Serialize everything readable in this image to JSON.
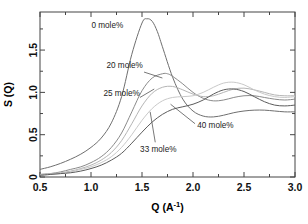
{
  "chart_data": {
    "type": "line",
    "title": "",
    "xlabel": "Q (A-1)",
    "xlabel_base": "Q (A",
    "xlabel_sup": "-1",
    "xlabel_tail": ")",
    "ylabel": "S (Q)",
    "xlim": [
      0.5,
      3.0
    ],
    "ylim": [
      0.0,
      1.95
    ],
    "grid": false,
    "legend_position": "inline-annotations",
    "xticks": [
      0.5,
      1.0,
      1.5,
      2.0,
      2.5,
      3.0
    ],
    "xtick_labels": [
      "0.5",
      "1.0",
      "1.5",
      "2.0",
      "2.5",
      "3.0"
    ],
    "xticks_minor": [
      0.75,
      1.25,
      1.75,
      2.25,
      2.75
    ],
    "yticks": [
      0.0,
      0.5,
      1.0,
      1.5
    ],
    "ytick_labels": [
      "0",
      "0.5",
      "1.0",
      "1.5"
    ],
    "yticks_minor": [
      0.25,
      0.75,
      1.25,
      1.75
    ],
    "series": [
      {
        "name": "0 mole%",
        "color": "#6f6f6f",
        "width": 1.0,
        "x": [
          0.5,
          0.6,
          0.7,
          0.8,
          0.9,
          1.0,
          1.1,
          1.2,
          1.3,
          1.4,
          1.5,
          1.55,
          1.6,
          1.65,
          1.7,
          1.8,
          1.9,
          2.0,
          2.1,
          2.2,
          2.3,
          2.4,
          2.5,
          2.6,
          2.7,
          2.8,
          2.9,
          3.0
        ],
        "y": [
          0.09,
          0.12,
          0.16,
          0.21,
          0.27,
          0.35,
          0.46,
          0.64,
          0.95,
          1.45,
          1.82,
          1.87,
          1.84,
          1.72,
          1.54,
          1.18,
          0.92,
          0.78,
          0.72,
          0.71,
          0.73,
          0.76,
          0.78,
          0.79,
          0.79,
          0.78,
          0.77,
          0.77
        ]
      },
      {
        "name": "20 mole%",
        "color": "#8a8a8a",
        "width": 1.0,
        "x": [
          0.5,
          0.6,
          0.7,
          0.8,
          0.9,
          1.0,
          1.1,
          1.2,
          1.3,
          1.4,
          1.5,
          1.6,
          1.7,
          1.75,
          1.8,
          1.9,
          2.0,
          2.1,
          2.2,
          2.3,
          2.4,
          2.5,
          2.6,
          2.7,
          2.8,
          2.9,
          3.0
        ],
        "y": [
          0.03,
          0.04,
          0.06,
          0.09,
          0.12,
          0.17,
          0.24,
          0.35,
          0.52,
          0.77,
          1.02,
          1.17,
          1.22,
          1.22,
          1.19,
          1.1,
          1.0,
          0.93,
          0.9,
          0.91,
          0.94,
          0.96,
          0.96,
          0.94,
          0.92,
          0.91,
          0.92
        ]
      },
      {
        "name": "25 mole%",
        "color": "#b5b5b5",
        "width": 1.0,
        "x": [
          0.5,
          0.6,
          0.7,
          0.8,
          0.9,
          1.0,
          1.1,
          1.2,
          1.3,
          1.4,
          1.5,
          1.6,
          1.7,
          1.8,
          1.9,
          2.0,
          2.1,
          2.2,
          2.3,
          2.4,
          2.5,
          2.6,
          2.7,
          2.8,
          2.9,
          3.0
        ],
        "y": [
          0.03,
          0.04,
          0.05,
          0.07,
          0.1,
          0.14,
          0.2,
          0.29,
          0.43,
          0.63,
          0.84,
          0.99,
          1.06,
          1.07,
          1.03,
          0.98,
          0.95,
          0.96,
          1.0,
          1.04,
          1.05,
          1.03,
          1.0,
          0.97,
          0.96,
          0.96
        ]
      },
      {
        "name": "33 mole%",
        "color": "#c9c9c9",
        "width": 1.0,
        "x": [
          0.5,
          0.6,
          0.7,
          0.8,
          0.9,
          1.0,
          1.1,
          1.2,
          1.3,
          1.4,
          1.5,
          1.6,
          1.7,
          1.8,
          1.9,
          2.0,
          2.1,
          2.2,
          2.3,
          2.4,
          2.5,
          2.6,
          2.7,
          2.8,
          2.9,
          3.0
        ],
        "y": [
          0.02,
          0.03,
          0.04,
          0.06,
          0.09,
          0.12,
          0.17,
          0.24,
          0.35,
          0.5,
          0.67,
          0.81,
          0.9,
          0.94,
          0.95,
          0.96,
          1.0,
          1.06,
          1.11,
          1.12,
          1.09,
          1.03,
          0.98,
          0.95,
          0.94,
          0.95
        ]
      },
      {
        "name": "40 mole%",
        "color": "#5c5c5c",
        "width": 1.0,
        "x": [
          0.5,
          0.6,
          0.7,
          0.8,
          0.9,
          1.0,
          1.1,
          1.2,
          1.3,
          1.4,
          1.5,
          1.6,
          1.7,
          1.8,
          1.9,
          2.0,
          2.1,
          2.2,
          2.3,
          2.4,
          2.5,
          2.6,
          2.7,
          2.8,
          2.9,
          3.0
        ],
        "y": [
          0.02,
          0.03,
          0.04,
          0.05,
          0.07,
          0.1,
          0.14,
          0.2,
          0.28,
          0.4,
          0.53,
          0.65,
          0.74,
          0.8,
          0.83,
          0.86,
          0.91,
          0.98,
          1.03,
          1.04,
          1.01,
          0.95,
          0.89,
          0.85,
          0.84,
          0.85
        ]
      }
    ],
    "annotations": [
      {
        "text": "0 mole%",
        "x": 1.16,
        "y": 1.76,
        "anchor": "middle",
        "leader": null
      },
      {
        "text": "20 mole%",
        "x": 1.33,
        "y": 1.29,
        "anchor": "middle",
        "leader": {
          "x1": 1.52,
          "y1": 1.24,
          "x2": 1.7,
          "y2": 1.17
        }
      },
      {
        "text": "25 mole%",
        "x": 1.3,
        "y": 0.96,
        "anchor": "middle",
        "leader": {
          "x1": 1.48,
          "y1": 0.94,
          "x2": 1.62,
          "y2": 1.04
        }
      },
      {
        "text": "33 mole%",
        "x": 1.66,
        "y": 0.3,
        "anchor": "middle",
        "leader": {
          "x1": 1.63,
          "y1": 0.41,
          "x2": 1.58,
          "y2": 0.77
        }
      },
      {
        "text": "40 mole%",
        "x": 2.22,
        "y": 0.58,
        "anchor": "middle",
        "leader": {
          "x1": 2.02,
          "y1": 0.63,
          "x2": 1.78,
          "y2": 0.86
        }
      }
    ]
  }
}
